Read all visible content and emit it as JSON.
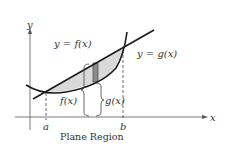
{
  "diagram": {
    "caption": "Plane Region",
    "axes": {
      "x_label": "x",
      "y_label": "y"
    },
    "curves": {
      "line_label": "y = f(x)",
      "parabola_label": "y = g(x)"
    },
    "bounds": {
      "a_label": "a",
      "b_label": "b"
    },
    "braces": {
      "f_label": "f(x)",
      "g_label": "g(x)"
    },
    "colors": {
      "stroke": "#1a1a1a",
      "region_fill": "#d9d9d9",
      "strip_fill": "#8c8c8c",
      "axis": "#555555",
      "text": "#333333"
    }
  }
}
